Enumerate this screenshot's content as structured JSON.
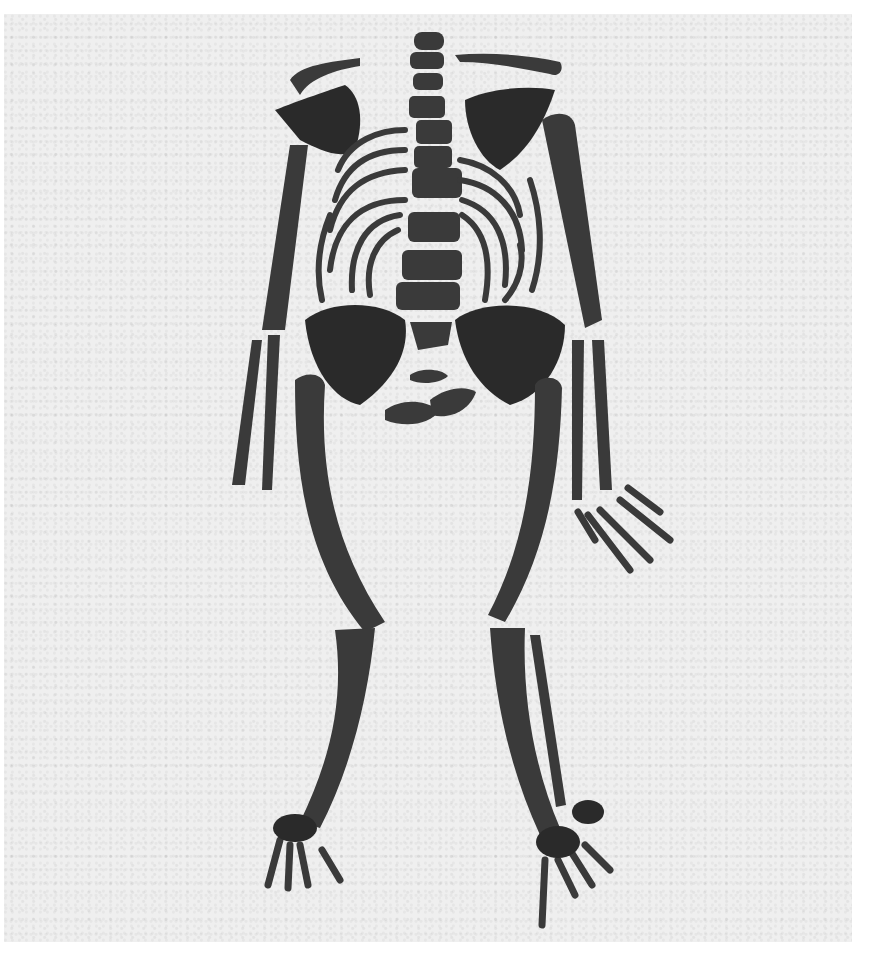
{
  "image": {
    "subject": "skeleton laid out on sand",
    "style": "black-and-white photograph",
    "colors": {
      "background": "#efefef",
      "border": "#ffffff",
      "bone": "#3a3a3a"
    }
  }
}
